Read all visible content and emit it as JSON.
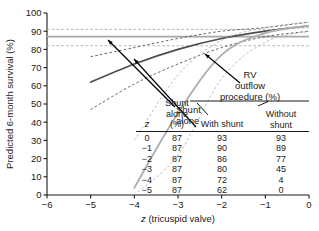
{
  "chart_data": {
    "type": "line",
    "title": "",
    "xlabel": "z (tricuspid valve)",
    "ylabel": "Predicted 6-month survival (%)",
    "xlim": [
      -6,
      0
    ],
    "ylim": [
      0,
      100
    ],
    "xticks": [
      "-6",
      "-5",
      "-4",
      "-3",
      "-2",
      "-1",
      "0"
    ],
    "yticks": [
      "0",
      "10",
      "20",
      "30",
      "40",
      "50",
      "60",
      "70",
      "80",
      "90",
      "100"
    ],
    "grid": false,
    "legend_position": "annotations-with-arrows",
    "series": [
      {
        "name": "Shunt alone",
        "style": "solid",
        "color": "#a8a8a8",
        "x": [
          -6,
          -5,
          -4,
          -3,
          -2,
          -1,
          0
        ],
        "values": [
          87,
          87,
          87,
          87,
          87,
          87,
          87
        ],
        "ci_upper": [
          91,
          91,
          91,
          91,
          91,
          91,
          92
        ],
        "ci_lower": [
          82,
          82,
          82,
          82,
          82,
          82,
          82
        ]
      },
      {
        "name": "RV outflow procedure with shunt",
        "style": "solid",
        "color": "#4d4d4d",
        "x": [
          -5,
          -4,
          -3,
          -2,
          -1,
          0
        ],
        "values": [
          62,
          72,
          80,
          86,
          90,
          93
        ],
        "ci_upper": [
          76,
          81,
          86,
          90,
          92,
          95
        ],
        "ci_lower": [
          47,
          61,
          72,
          81,
          87,
          90
        ]
      },
      {
        "name": "RV outflow procedure without shunt",
        "style": "solid",
        "color": "#b0b0b0",
        "x": [
          -4,
          -3,
          -2,
          -1,
          0
        ],
        "values": [
          4,
          45,
          77,
          89,
          93
        ],
        "ci_upper": [
          30,
          66,
          85,
          92,
          95
        ],
        "ci_lower": [
          0,
          22,
          64,
          84,
          90
        ]
      }
    ],
    "annotations": [
      {
        "label": "Shunt alone",
        "target_x": -3.0,
        "target_y": 87
      },
      {
        "label": "With shunt",
        "target_x": -1.95,
        "target_y": 86
      },
      {
        "label": "RV outflow procedure (%)",
        "target_x": -1.35,
        "target_y": 85
      }
    ]
  },
  "axes": {
    "ylabel": "Predicted 6-month survival (%)",
    "xlabel_italic": "z",
    "xlabel_rest": " (tricuspid valve)",
    "yticks": [
      "100",
      "90",
      "80",
      "70",
      "60",
      "50",
      "40",
      "30",
      "20",
      "10",
      "0"
    ],
    "xticks": [
      "-6",
      "-5",
      "-4",
      "-3",
      "-2",
      "-1",
      "0"
    ]
  },
  "annotations": {
    "shunt_alone_line1": "Shunt",
    "shunt_alone_line2": "alone",
    "rv_line1": "RV",
    "rv_line2": "outflow",
    "rv_line3": "procedure (%)"
  },
  "table": {
    "header_group": "RV outflow procedure (%)",
    "columns": [
      {
        "key": "z",
        "label": "z",
        "italic": true
      },
      {
        "key": "shunt_alone",
        "label_line1": "Shunt",
        "label_line2": "alone",
        "label_line3": "(%)"
      },
      {
        "key": "with_shunt",
        "label": "With shunt"
      },
      {
        "key": "without_shunt",
        "label_line1": "Without",
        "label_line2": "shunt"
      }
    ],
    "rows": [
      {
        "z": "0",
        "shunt_alone": "87",
        "with_shunt": "93",
        "without_shunt": "93"
      },
      {
        "z": "-1",
        "shunt_alone": "87",
        "with_shunt": "90",
        "without_shunt": "89"
      },
      {
        "z": "-2",
        "shunt_alone": "87",
        "with_shunt": "86",
        "without_shunt": "77"
      },
      {
        "z": "-3",
        "shunt_alone": "87",
        "with_shunt": "80",
        "without_shunt": "45"
      },
      {
        "z": "-4",
        "shunt_alone": "87",
        "with_shunt": "72",
        "without_shunt": "4"
      },
      {
        "z": "-5",
        "shunt_alone": "87",
        "with_shunt": "62",
        "without_shunt": "0"
      }
    ]
  },
  "colors": {
    "shunt_alone": "#a8a8a8",
    "with_shunt": "#4d4d4d",
    "without_shunt": "#b0b0b0",
    "axis": "#1a1a1a",
    "background": "#ffffff"
  }
}
